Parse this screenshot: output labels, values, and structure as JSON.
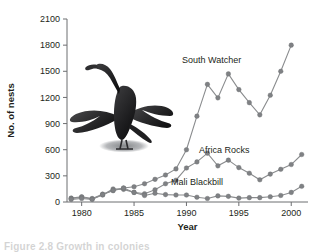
{
  "figure": {
    "caption_partial": "Figure 2.8  Growth in colonies",
    "illustration_name": "cormorant-bird-illustration"
  },
  "chart_data": {
    "type": "line",
    "title": "",
    "xlabel": "Year",
    "ylabel": "No. of nests",
    "xlim": [
      1978.6,
      2001.6
    ],
    "ylim": [
      0,
      2100
    ],
    "xticks": [
      1980,
      1985,
      1990,
      1995,
      2000
    ],
    "yticks": [
      0,
      300,
      600,
      900,
      1200,
      1500,
      1800,
      2100
    ],
    "grid": false,
    "legend_position": "inline-annotations",
    "marker": "circle",
    "x": [
      1979,
      1980,
      1981,
      1982,
      1983,
      1984,
      1985,
      1986,
      1987,
      1988,
      1989,
      1990,
      1991,
      1992,
      1993,
      1994,
      1995,
      1996,
      1997,
      1998,
      1999,
      2000,
      2001
    ],
    "series": [
      {
        "name": "South Watcher",
        "color": "#7f8184",
        "label_x": 1992.4,
        "label_y": 1590,
        "values": [
          45,
          60,
          40,
          90,
          130,
          160,
          175,
          210,
          260,
          310,
          380,
          600,
          985,
          1350,
          1195,
          1470,
          1290,
          1140,
          1000,
          1225,
          1500,
          1800,
          null
        ]
      },
      {
        "name": "Africa Rocks",
        "color": "#7f8184",
        "label_x": 1993.6,
        "label_y": 560,
        "values": [
          40,
          55,
          35,
          80,
          150,
          145,
          110,
          95,
          140,
          210,
          250,
          390,
          460,
          560,
          415,
          480,
          395,
          330,
          255,
          320,
          375,
          430,
          545
        ]
      },
      {
        "name": "Mali Blackbill",
        "color": "#7f8184",
        "label_x": 1991.0,
        "label_y": 195,
        "values": [
          30,
          40,
          30,
          85,
          135,
          160,
          110,
          75,
          100,
          85,
          80,
          80,
          55,
          40,
          70,
          65,
          45,
          50,
          50,
          60,
          75,
          110,
          180
        ]
      }
    ]
  }
}
